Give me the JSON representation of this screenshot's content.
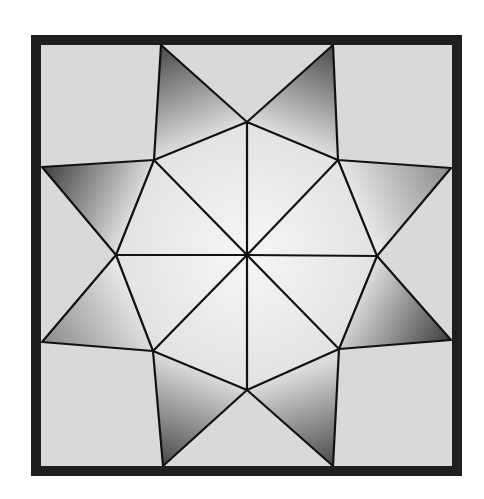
{
  "diagram": {
    "frame": {
      "outer": [
        31,
        35,
        462,
        476
      ],
      "inner": [
        41,
        45,
        452,
        466
      ],
      "color": "#1f1f1f"
    },
    "colors": {
      "background": "#dadada",
      "light_piece": "#e4e4e4",
      "center_highlight": "#f4f4f4",
      "dark_shade": "#505050",
      "line": "#111111"
    },
    "center": [
      247,
      255
    ],
    "octagon_vertices": {
      "top": [
        247,
        122
      ],
      "top_right": [
        338,
        160
      ],
      "right": [
        377,
        256
      ],
      "bottom_right": [
        339,
        349
      ],
      "bottom": [
        247,
        390
      ],
      "bottom_left": [
        153,
        351
      ],
      "left": [
        116,
        255
      ],
      "top_left": [
        154,
        160
      ]
    },
    "star_points": {
      "top_left": [
        161,
        45
      ],
      "top_right": [
        333,
        45
      ],
      "right_top": [
        451,
        168
      ],
      "right_bottom": [
        451,
        340
      ],
      "bottom_right": [
        333,
        466
      ],
      "bottom_left": [
        163,
        466
      ],
      "left_bottom": [
        42,
        342
      ],
      "left_top": [
        42,
        167
      ]
    },
    "shaded_triangles": [
      {
        "name": "top-left-point",
        "points": [
          [
            161,
            45
          ],
          [
            247,
            122
          ],
          [
            154,
            160
          ]
        ],
        "dark_corner": [
          161,
          45
        ]
      },
      {
        "name": "top-right-point",
        "points": [
          [
            333,
            45
          ],
          [
            338,
            160
          ],
          [
            247,
            122
          ]
        ],
        "dark_corner": [
          333,
          45
        ]
      },
      {
        "name": "right-top-point",
        "points": [
          [
            451,
            168
          ],
          [
            377,
            256
          ],
          [
            338,
            160
          ]
        ],
        "dark_corner": [
          451,
          168
        ]
      },
      {
        "name": "right-bottom-point",
        "points": [
          [
            451,
            340
          ],
          [
            339,
            349
          ],
          [
            377,
            256
          ]
        ],
        "dark_corner": [
          451,
          340
        ]
      },
      {
        "name": "bottom-right-point",
        "points": [
          [
            333,
            466
          ],
          [
            247,
            390
          ],
          [
            339,
            349
          ]
        ],
        "dark_corner": [
          333,
          466
        ]
      },
      {
        "name": "bottom-left-point",
        "points": [
          [
            163,
            466
          ],
          [
            153,
            351
          ],
          [
            247,
            390
          ]
        ],
        "dark_corner": [
          163,
          466
        ]
      },
      {
        "name": "left-bottom-point",
        "points": [
          [
            42,
            342
          ],
          [
            116,
            255
          ],
          [
            153,
            351
          ]
        ],
        "dark_corner": [
          42,
          342
        ]
      },
      {
        "name": "left-top-point",
        "points": [
          [
            42,
            167
          ],
          [
            154,
            160
          ],
          [
            116,
            255
          ]
        ],
        "dark_corner": [
          42,
          167
        ]
      }
    ]
  }
}
